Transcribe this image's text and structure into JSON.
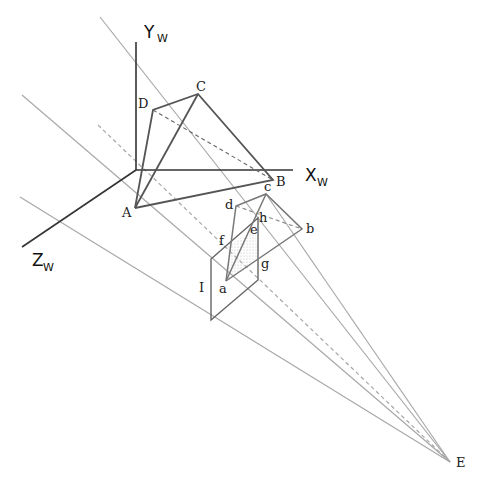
{
  "diagram": {
    "type": "perspective-projection",
    "axes": {
      "x_label": "X",
      "x_sub": "W",
      "y_label": "Y",
      "y_sub": "W",
      "z_label": "Z",
      "z_sub": "W"
    },
    "object_points": {
      "A": "A",
      "B": "B",
      "C": "C",
      "D": "D"
    },
    "image_points": {
      "a": "a",
      "b": "b",
      "c": "c",
      "d": "d",
      "e": "e",
      "f": "f",
      "g": "g",
      "h": "h"
    },
    "image_plane_label": "I",
    "eye_label": "E",
    "colors": {
      "axis": "#333333",
      "object": "#555555",
      "ray": "#a8a8a8"
    }
  }
}
